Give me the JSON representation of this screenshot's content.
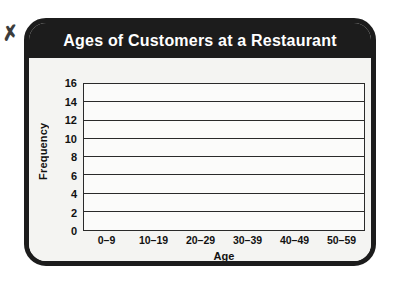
{
  "artifact": {
    "ink_mark_glyph": "✗"
  },
  "card": {
    "title": "Ages of Customers at a Restaurant"
  },
  "chart_data": {
    "type": "bar",
    "title": "Ages of Customers at a Restaurant",
    "xlabel": "Age",
    "ylabel": "Frequency",
    "categories": [
      "0–9",
      "10–19",
      "20–29",
      "30–39",
      "40–49",
      "50–59"
    ],
    "values": [
      6,
      9,
      13,
      11,
      15,
      9
    ],
    "bar_colors": [
      "#3f3f3f",
      "#b8b8b8",
      "#3f3f3f",
      "#b8b8b8",
      "#3f3f3f",
      "#b8b8b8"
    ],
    "ylim": [
      0,
      16
    ],
    "yticks": [
      0,
      2,
      4,
      6,
      8,
      10,
      12,
      14,
      16
    ],
    "ytick_labels": [
      "0",
      "2",
      "4",
      "6",
      "8",
      "10",
      "12",
      "14",
      "16"
    ],
    "gridlines": [
      2,
      4,
      6,
      8,
      10,
      12,
      14,
      16
    ],
    "grid": true,
    "legend": "none",
    "colors": {
      "dark_bar": "#3f3f3f",
      "light_bar": "#b8b8b8",
      "frame": "#1c1c1c",
      "title_text": "#ffffff",
      "plot_bg": "#fbfbfa",
      "axis_line": "#2a2a2a"
    }
  }
}
